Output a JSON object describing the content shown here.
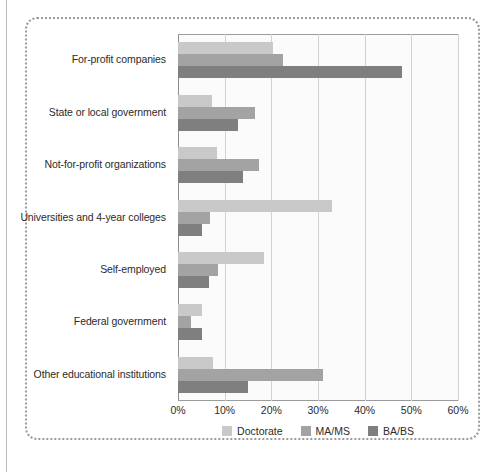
{
  "figure": {
    "frame_style": "dotted-rounded-border",
    "background": "#ffffff"
  },
  "chart_data": {
    "type": "bar",
    "orientation": "horizontal",
    "title": "",
    "subtitle": "",
    "xlabel": "",
    "ylabel": "",
    "xlim": [
      0,
      60
    ],
    "xticks": [
      0,
      10,
      20,
      30,
      40,
      50,
      60
    ],
    "xtick_labels": [
      "0%",
      "10%",
      "20%",
      "30%",
      "40%",
      "50%",
      "60%"
    ],
    "grid": true,
    "grid_axis": "x",
    "legend_position": "bottom-center",
    "categories": [
      "For-profit companies",
      "State or local government",
      "Not-for-profit organizations",
      "Universities and 4-year colleges",
      "Self-employed",
      "Federal government",
      "Other educational institutions"
    ],
    "series": [
      {
        "name": "Doctorate",
        "color": "#c9c9c9",
        "values": [
          20.3,
          7.3,
          8.4,
          33.0,
          18.4,
          5.1,
          7.6
        ]
      },
      {
        "name": "MA/MS",
        "color": "#a3a3a3",
        "values": [
          22.5,
          16.5,
          17.4,
          6.9,
          8.6,
          2.8,
          31.0
        ]
      },
      {
        "name": "BA/BS",
        "color": "#7f7f7f",
        "values": [
          48.0,
          12.9,
          14.0,
          5.2,
          6.6,
          5.2,
          15.0
        ]
      }
    ]
  },
  "colors": {
    "doctorate": "#c9c9c9",
    "ma_ms": "#a3a3a3",
    "ba_bs": "#7f7f7f",
    "gridline": "#d2d2d2",
    "axis": "#8d8d8d",
    "plot_background": "#fbfbfb",
    "frame_border": "#9a9a9a",
    "text": "#2b2b2b"
  }
}
